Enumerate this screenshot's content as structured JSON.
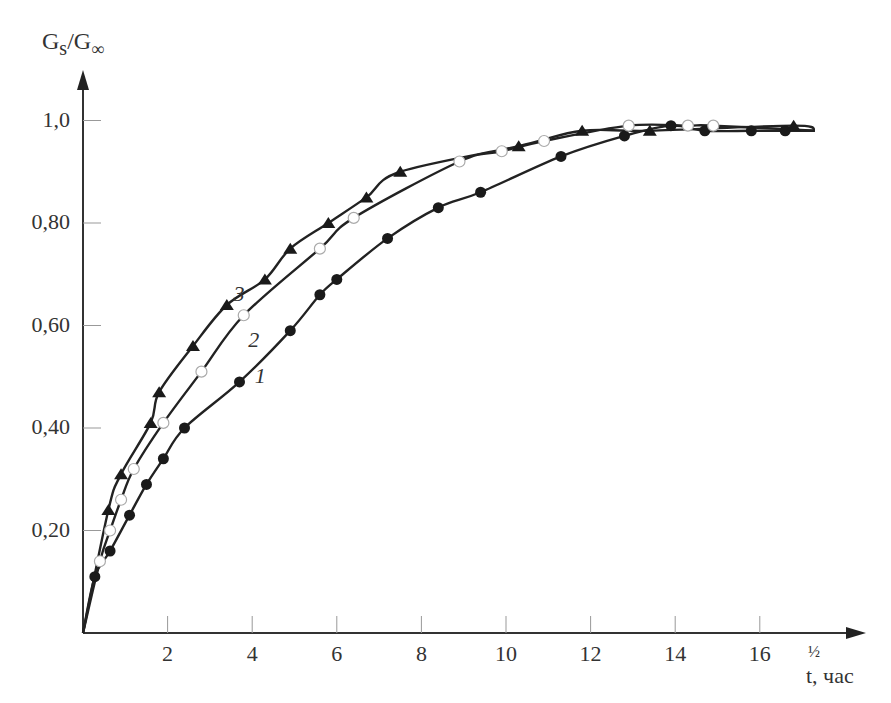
{
  "chart_data": {
    "type": "scatter",
    "title": "",
    "xlabel": "t, час",
    "xlabel_superscript": "½",
    "ylabel": "Gs/G∞",
    "xlim": [
      0,
      18
    ],
    "ylim": [
      0,
      1.05
    ],
    "grid": false,
    "legend": "curve labels on plot (1, 2, 3)",
    "x_ticks": [
      2,
      4,
      6,
      8,
      10,
      12,
      14,
      16
    ],
    "x_tick_labels": [
      "2",
      "4",
      "6",
      "8",
      "10",
      "12",
      "14",
      "16"
    ],
    "y_ticks": [
      0.2,
      0.4,
      0.6,
      0.8,
      1.0
    ],
    "y_tick_labels": [
      "0,20",
      "0,40",
      "0,60",
      "0,80",
      "1,0"
    ],
    "series": [
      {
        "name": "1",
        "marker": "filled-circle",
        "x": [
          0.28,
          0.64,
          1.1,
          1.5,
          1.9,
          2.4,
          3.7,
          4.9,
          5.6,
          6.0,
          7.2,
          8.4,
          9.4,
          11.3,
          12.8,
          13.9,
          14.7,
          15.8,
          16.6
        ],
        "y": [
          0.11,
          0.16,
          0.23,
          0.29,
          0.34,
          0.4,
          0.49,
          0.59,
          0.66,
          0.69,
          0.77,
          0.83,
          0.86,
          0.93,
          0.97,
          0.99,
          0.98,
          0.98,
          0.98
        ]
      },
      {
        "name": "2",
        "marker": "open-circle",
        "x": [
          0.4,
          0.64,
          0.9,
          1.2,
          1.9,
          2.8,
          3.8,
          5.6,
          6.4,
          8.9,
          9.9,
          10.9,
          12.9,
          14.3,
          14.9
        ],
        "y": [
          0.14,
          0.2,
          0.26,
          0.32,
          0.41,
          0.51,
          0.62,
          0.75,
          0.81,
          0.92,
          0.94,
          0.96,
          0.99,
          0.99,
          0.99
        ]
      },
      {
        "name": "3",
        "marker": "filled-triangle",
        "x": [
          0.6,
          0.9,
          1.6,
          1.8,
          2.6,
          3.4,
          4.3,
          4.9,
          5.8,
          6.7,
          7.5,
          10.3,
          11.8,
          13.4,
          16.8
        ],
        "y": [
          0.24,
          0.31,
          0.41,
          0.47,
          0.56,
          0.64,
          0.69,
          0.75,
          0.8,
          0.85,
          0.9,
          0.95,
          0.98,
          0.98,
          0.99
        ]
      }
    ],
    "curve_label_positions": [
      {
        "label": "1",
        "x": 4.2,
        "y": 0.5
      },
      {
        "label": "2",
        "x": 4.05,
        "y": 0.57
      },
      {
        "label": "3",
        "x": 3.7,
        "y": 0.66
      }
    ]
  },
  "axes": {
    "y_title_main": "G",
    "y_title_sub1": "s",
    "y_title_slash": "/G",
    "y_title_sub2": "∞",
    "x_title": "t, час",
    "x_title_power": "½"
  }
}
